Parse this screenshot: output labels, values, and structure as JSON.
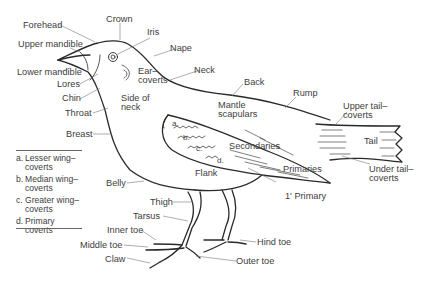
{
  "diagram": {
    "line_color": "#2a2a2a",
    "leader_color": "#777777",
    "labels": {
      "forehead": "Forehead",
      "crown": "Crown",
      "iris": "Iris",
      "upper_mandible": "Upper mandible",
      "nape": "Nape",
      "ear_coverts": "Ear–\ncoverts",
      "neck": "Neck",
      "lower_mandible": "Lower mandible",
      "lores": "Lores",
      "chin": "Chin",
      "side_of_neck": "Side of\nneck",
      "throat": "Throat",
      "back": "Back",
      "rump": "Rump",
      "mantle_scapulars": "Mantle\nscapulars",
      "upper_tail_coverts": "Upper tail–\ncoverts",
      "tail": "Tail",
      "breast": "Breast",
      "secondaries": "Secondaries",
      "primaries": "Primaries",
      "under_tail_coverts": "Under tail–\ncoverts",
      "belly": "Belly",
      "flank": "Flank",
      "first_primary": "1' Primary",
      "thigh": "Thigh",
      "tarsus": "Tarsus",
      "inner_toe": "Inner toe",
      "middle_toe": "Middle toe",
      "hind_toe": "Hind toe",
      "claw": "Claw",
      "outer_toe": "Outer toe",
      "wing_a": "a.",
      "wing_b": "b.",
      "wing_c": "c.",
      "wing_d": "d."
    },
    "legend": [
      {
        "key": "a.",
        "text": "Lesser wing–\ncoverts"
      },
      {
        "key": "b.",
        "text": "Median wing–\ncoverts"
      },
      {
        "key": "c.",
        "text": "Greater wing–\ncoverts"
      },
      {
        "key": "d.",
        "text": "Primary\ncoverts"
      }
    ]
  }
}
